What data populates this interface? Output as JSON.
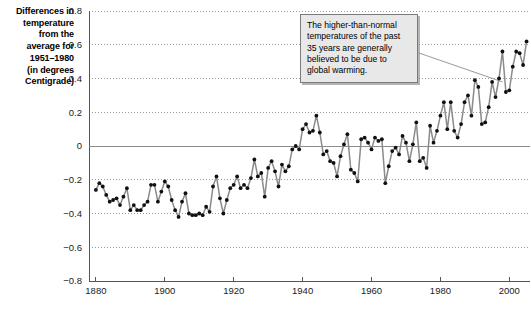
{
  "axis_title": {
    "lines": [
      "Differences in",
      "temperature",
      "from the",
      "average for",
      "1951–1980",
      "(in degrees",
      "Centigrade)"
    ]
  },
  "annotation": {
    "text": "The higher-than-normal temperatures of the past 35 years are generally believed to be due to global warming."
  },
  "bottom_caption": {
    "text": ""
  },
  "colors": {
    "line": "#8a8a8a",
    "marker": "#101010",
    "gridline": "#9a9a9a",
    "zero_line": "#8c8c8c",
    "axis": "#555555",
    "callout_bg": "#e8e8e8",
    "callout_border": "#7a7a7a",
    "text": "#000000"
  },
  "chart_data": {
    "type": "line",
    "title": "Differences in temperature from the average for 1951–1980 (in degrees Centigrade)",
    "xlabel": "",
    "ylabel": "Differences in temperature from the average for 1951–1980 (in degrees Centigrade)",
    "xlim": [
      1878,
      2006
    ],
    "ylim": [
      -0.8,
      0.8
    ],
    "ytick_labels": [
      "0.8",
      "0.6",
      "0.4",
      "0.2",
      "0",
      "−0.2",
      "−0.4",
      "−0.6",
      "−0.8"
    ],
    "ytick_values": [
      0.8,
      0.6,
      0.4,
      0.2,
      0,
      -0.2,
      -0.4,
      -0.6,
      -0.8
    ],
    "xtick_labels": [
      "1880",
      "1900",
      "1920",
      "1940",
      "1960",
      "1980",
      "2000"
    ],
    "xtick_values": [
      1880,
      1900,
      1920,
      1940,
      1960,
      1980,
      2000
    ],
    "grid": true,
    "legend": false,
    "markers": true,
    "series": [
      {
        "name": "Global temperature anomaly",
        "x": [
          1880,
          1881,
          1882,
          1883,
          1884,
          1885,
          1886,
          1887,
          1888,
          1889,
          1890,
          1891,
          1892,
          1893,
          1894,
          1895,
          1896,
          1897,
          1898,
          1899,
          1900,
          1901,
          1902,
          1903,
          1904,
          1905,
          1906,
          1907,
          1908,
          1909,
          1910,
          1911,
          1912,
          1913,
          1914,
          1915,
          1916,
          1917,
          1918,
          1919,
          1920,
          1921,
          1922,
          1923,
          1924,
          1925,
          1926,
          1927,
          1928,
          1929,
          1930,
          1931,
          1932,
          1933,
          1934,
          1935,
          1936,
          1937,
          1938,
          1939,
          1940,
          1941,
          1942,
          1943,
          1944,
          1945,
          1946,
          1947,
          1948,
          1949,
          1950,
          1951,
          1952,
          1953,
          1954,
          1955,
          1956,
          1957,
          1958,
          1959,
          1960,
          1961,
          1962,
          1963,
          1964,
          1965,
          1966,
          1967,
          1968,
          1969,
          1970,
          1971,
          1972,
          1973,
          1974,
          1975,
          1976,
          1977,
          1978,
          1979,
          1980,
          1981,
          1982,
          1983,
          1984,
          1985,
          1986,
          1987,
          1988,
          1989,
          1990,
          1991,
          1992,
          1993,
          1994,
          1995,
          1996,
          1997,
          1998,
          1999,
          2000,
          2001,
          2002,
          2003,
          2004,
          2005
        ],
        "values": [
          -0.26,
          -0.22,
          -0.24,
          -0.29,
          -0.33,
          -0.32,
          -0.31,
          -0.35,
          -0.3,
          -0.25,
          -0.38,
          -0.35,
          -0.38,
          -0.38,
          -0.35,
          -0.33,
          -0.23,
          -0.23,
          -0.33,
          -0.27,
          -0.21,
          -0.24,
          -0.32,
          -0.38,
          -0.42,
          -0.33,
          -0.28,
          -0.4,
          -0.41,
          -0.41,
          -0.4,
          -0.41,
          -0.36,
          -0.39,
          -0.24,
          -0.18,
          -0.31,
          -0.4,
          -0.32,
          -0.25,
          -0.23,
          -0.18,
          -0.25,
          -0.23,
          -0.25,
          -0.19,
          -0.08,
          -0.18,
          -0.16,
          -0.3,
          -0.13,
          -0.09,
          -0.15,
          -0.24,
          -0.11,
          -0.15,
          -0.12,
          -0.02,
          0.0,
          -0.02,
          0.1,
          0.13,
          0.08,
          0.09,
          0.18,
          0.08,
          -0.05,
          -0.03,
          -0.09,
          -0.1,
          -0.18,
          -0.06,
          0.01,
          0.07,
          -0.14,
          -0.16,
          -0.21,
          0.04,
          0.05,
          0.02,
          -0.02,
          0.05,
          0.03,
          0.04,
          -0.22,
          -0.12,
          -0.03,
          -0.01,
          -0.05,
          0.06,
          0.02,
          -0.09,
          0.01,
          0.14,
          -0.09,
          -0.07,
          -0.13,
          0.12,
          0.02,
          0.09,
          0.18,
          0.26,
          0.1,
          0.26,
          0.09,
          0.05,
          0.13,
          0.26,
          0.3,
          0.18,
          0.39,
          0.35,
          0.13,
          0.14,
          0.23,
          0.38,
          0.29,
          0.4,
          0.56,
          0.32,
          0.33,
          0.47,
          0.56,
          0.55,
          0.48,
          0.62
        ]
      }
    ],
    "annotations": [
      {
        "text": "The higher-than-normal temperatures of the past 35 years are generally believed to be due to global warming.",
        "target_x": 1998,
        "target_y": 0.38
      }
    ]
  }
}
